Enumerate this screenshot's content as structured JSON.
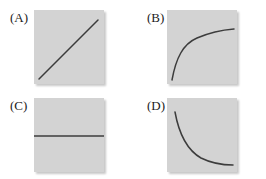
{
  "figure": {
    "title": "",
    "background_color": "#ffffff",
    "panel_fill_color": "#d3d3d3",
    "curve_color": "#3c3c3c",
    "layout": "2x2 grid of labeled plot panels"
  },
  "chart_data": {
    "type": "line",
    "title": "",
    "xlabel": "",
    "ylabel": "",
    "grid": false,
    "legend": null,
    "panels": [
      {
        "label": "(A)",
        "shape": "linear increasing",
        "xlim": [
          0,
          1
        ],
        "ylim": [
          0,
          1
        ],
        "x": [
          0.05,
          0.2,
          0.35,
          0.5,
          0.65,
          0.8,
          0.92
        ],
        "y": [
          0.05,
          0.2,
          0.35,
          0.5,
          0.65,
          0.8,
          0.92
        ],
        "path": "M 5,69 L 64,10"
      },
      {
        "label": "(B)",
        "shape": "concave increasing (logarithmic), asymptotic plateau",
        "xlim": [
          0,
          1
        ],
        "ylim": [
          0,
          1
        ],
        "x": [
          0.07,
          0.12,
          0.2,
          0.32,
          0.48,
          0.65,
          0.82,
          0.96
        ],
        "y": [
          0.04,
          0.26,
          0.45,
          0.6,
          0.69,
          0.73,
          0.75,
          0.76
        ],
        "path": "M 5,70 C 9,48 16,34 30,28 C 44,22 54,20 67,19"
      },
      {
        "label": "(C)",
        "shape": "constant (horizontal)",
        "xlim": [
          0,
          1
        ],
        "ylim": [
          0,
          1
        ],
        "x": [
          0.0,
          1.0
        ],
        "y": [
          0.5,
          0.5
        ],
        "path": "M 0,38 L 70,38"
      },
      {
        "label": "(D)",
        "shape": "convex decreasing (exponential decay), asymptotic floor",
        "xlim": [
          0,
          1
        ],
        "ylim": [
          0,
          1
        ],
        "x": [
          0.1,
          0.18,
          0.3,
          0.45,
          0.6,
          0.78,
          0.93
        ],
        "y": [
          0.82,
          0.62,
          0.4,
          0.24,
          0.15,
          0.1,
          0.08
        ],
        "path": "M 8,14 C 12,36 20,52 34,60 C 46,66 56,67 66,67"
      }
    ]
  },
  "panels": {
    "a": {
      "label": "(A)"
    },
    "b": {
      "label": "(B)"
    },
    "c": {
      "label": "(C)"
    },
    "d": {
      "label": "(D)"
    }
  }
}
